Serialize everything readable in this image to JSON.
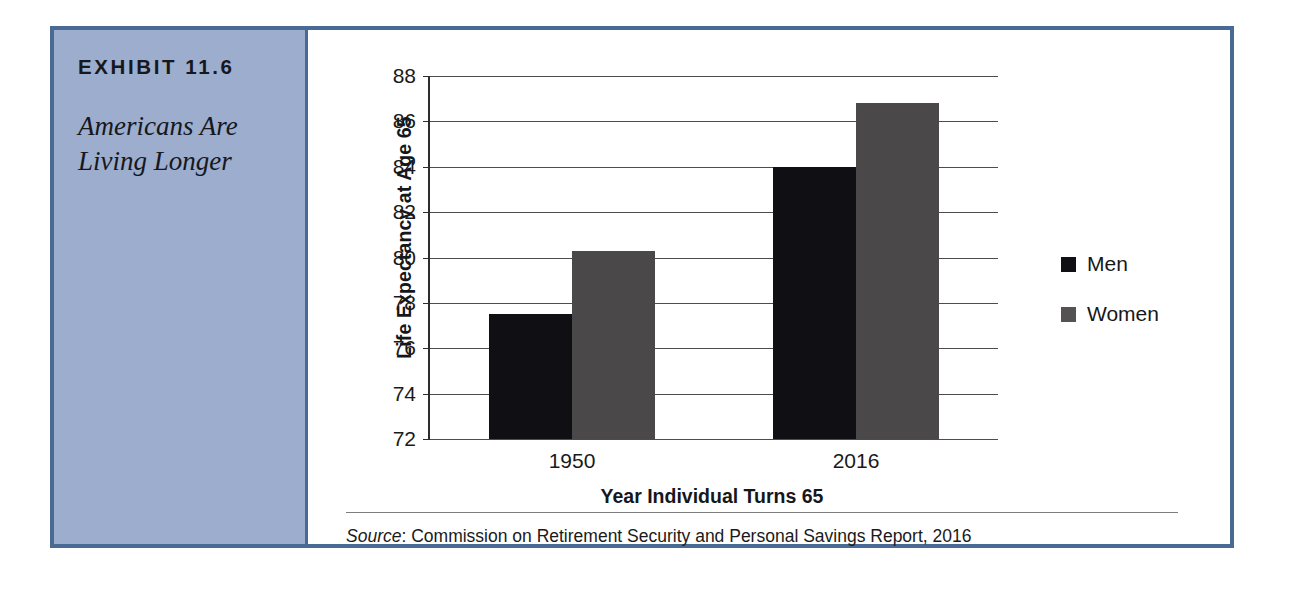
{
  "exhibit": {
    "number": "EXHIBIT 11.6",
    "title": "Americans Are\nLiving Longer",
    "title_line1": "Americans Are",
    "title_line2": "Living Longer",
    "source_label": "Source",
    "source_text": ": Commission on Retirement Security and Personal Savings Report, 2016",
    "colors": {
      "frame_border": "#4a6a96",
      "sidebar_background": "#9cadcd",
      "page_background": "#ffffff"
    }
  },
  "chart_data": {
    "type": "bar",
    "title": "",
    "categories": [
      "1950",
      "2016"
    ],
    "series": [
      {
        "name": "Men",
        "values": [
          77.5,
          84.0
        ],
        "color": "#101014"
      },
      {
        "name": "Women",
        "values": [
          80.3,
          86.8
        ],
        "color": "#4b484a"
      }
    ],
    "xlabel": "Year Individual Turns 65",
    "ylabel": "Life Expectancy at Age 65",
    "ylim": [
      72,
      88
    ],
    "ytick_step": 2,
    "yticks": [
      88,
      86,
      84,
      82,
      80,
      78,
      76,
      74,
      72
    ],
    "ytick_labels": [
      "88",
      "86",
      "84",
      "82",
      "80",
      "78",
      "76",
      "74",
      "72"
    ],
    "grid": true,
    "grid_axis": "y",
    "legend": [
      "Men",
      "Women"
    ],
    "legend_position": "right"
  }
}
